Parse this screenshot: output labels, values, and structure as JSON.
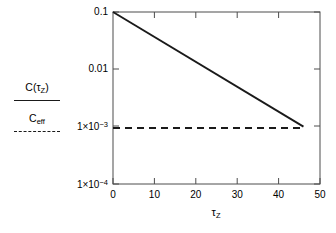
{
  "chart_data": {
    "type": "line",
    "title": "",
    "xlabel": "τZ",
    "ylabel": "",
    "xlim": [
      0,
      50
    ],
    "ylim": [
      0.0001,
      0.1
    ],
    "yscale": "log",
    "xscale": "linear",
    "grid": false,
    "x_ticks": [
      "0",
      "10",
      "20",
      "30",
      "40",
      "50"
    ],
    "x_tick_values": [
      0,
      10,
      20,
      30,
      40,
      50
    ],
    "y_ticks": [
      "0.1",
      "0.01",
      "1×10⁻³",
      "1×10⁻⁴"
    ],
    "y_tick_values": [
      0.1,
      0.01,
      0.001,
      0.0001
    ],
    "legend_position": "left-outside",
    "series": [
      {
        "name": "C(τZ)",
        "style": "solid",
        "color": "#1a1a1a",
        "x": [
          0,
          46
        ],
        "values": [
          0.1,
          0.001
        ]
      },
      {
        "name": "Ceff",
        "style": "dashed",
        "color": "#1a1a1a",
        "x": [
          0,
          46
        ],
        "values": [
          0.00095,
          0.00095
        ]
      }
    ]
  },
  "legend": {
    "items": [
      {
        "label_main": "C(",
        "label_tau": "τ",
        "label_sub": "Z",
        "label_close": ")",
        "style": "solid"
      },
      {
        "label_main": "C",
        "label_sub": "eff",
        "style": "dashed"
      }
    ]
  },
  "axes": {
    "x_title_main": "τ",
    "x_title_sub": "Z",
    "y_tick_0": "0.1",
    "y_tick_1": "0.01",
    "y_tick_2_mant": "1×10",
    "y_tick_2_exp": "−3",
    "y_tick_3_mant": "1×10",
    "y_tick_3_exp": "−4",
    "x_tick_0": "0",
    "x_tick_1": "10",
    "x_tick_2": "20",
    "x_tick_3": "30",
    "x_tick_4": "40",
    "x_tick_5": "50"
  },
  "colors": {
    "line": "#1a1a1a",
    "frame": "#4d4d4d",
    "background": "#ffffff"
  }
}
